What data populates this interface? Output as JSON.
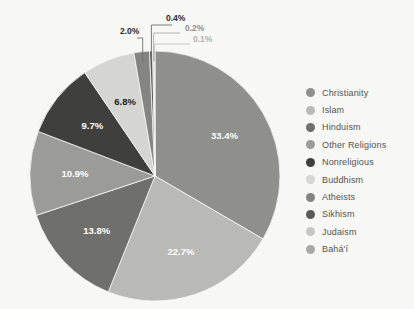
{
  "background": "#f7f7f5",
  "chart_data": {
    "type": "pie",
    "title": "",
    "subtitle": "",
    "xlabel": "",
    "ylabel": "",
    "legend_position": "right",
    "grid": false,
    "start_angle_deg": 0,
    "direction": "clockwise",
    "center": {
      "x": 155,
      "y": 176
    },
    "radius": 125,
    "categories": [
      "Christianity",
      "Islam",
      "Hinduism",
      "Other Religions",
      "Nonreligious",
      "Buddhism",
      "Atheists",
      "Sikhism",
      "Judaism",
      "Bahá'í"
    ],
    "values": [
      33.4,
      22.7,
      13.8,
      10.9,
      9.7,
      6.8,
      2.0,
      0.4,
      0.2,
      0.1
    ],
    "value_labels": [
      "33.4%",
      "22.7%",
      "13.8%",
      "10.9%",
      "9.7%",
      "6.8%",
      "2.0%",
      "0.4%",
      "0.2%",
      "0.1%"
    ],
    "colors": [
      "#8f8f8c",
      "#b9b9b5",
      "#6f6f6c",
      "#9b9b97",
      "#3f3f3d",
      "#d5d5d1",
      "#848480",
      "#5a5a57",
      "#c6c6c2",
      "#a8a8a4"
    ],
    "slices": [
      {
        "label": "Christianity",
        "value": 33.4,
        "text": "33.4%",
        "color": "#8f8f8c",
        "label_placement": "inside",
        "label_style": "light"
      },
      {
        "label": "Islam",
        "value": 22.7,
        "text": "22.7%",
        "color": "#b9b9b5",
        "label_placement": "inside",
        "label_style": "light"
      },
      {
        "label": "Hinduism",
        "value": 13.8,
        "text": "13.8%",
        "color": "#6f6f6c",
        "label_placement": "inside",
        "label_style": "light"
      },
      {
        "label": "Other Religions",
        "value": 10.9,
        "text": "10.9%",
        "color": "#9b9b97",
        "label_placement": "inside",
        "label_style": "light"
      },
      {
        "label": "Nonreligious",
        "value": 9.7,
        "text": "9.7%",
        "color": "#3f3f3d",
        "label_placement": "inside",
        "label_style": "light"
      },
      {
        "label": "Buddhism",
        "value": 6.8,
        "text": "6.8%",
        "color": "#d5d5d1",
        "label_placement": "inside",
        "label_style": "dark"
      },
      {
        "label": "Atheists",
        "value": 2.0,
        "text": "2.0%",
        "color": "#848480",
        "label_placement": "outside",
        "label_style": "dark"
      },
      {
        "label": "Sikhism",
        "value": 0.4,
        "text": "0.4%",
        "color": "#5a5a57",
        "label_placement": "outside",
        "label_style": "dark"
      },
      {
        "label": "Judaism",
        "value": 0.2,
        "text": "0.2%",
        "color": "#c6c6c2",
        "label_placement": "outside",
        "label_style": "mid"
      },
      {
        "label": "Bahá'í",
        "value": 0.1,
        "text": "0.1%",
        "color": "#a8a8a4",
        "label_placement": "outside",
        "label_style": "light-gray"
      }
    ]
  },
  "legend": {
    "items": [
      {
        "label": "Christianity",
        "color": "#8f8f8c"
      },
      {
        "label": "Islam",
        "color": "#b9b9b5"
      },
      {
        "label": "Hinduism",
        "color": "#6f6f6c"
      },
      {
        "label": "Other Religions",
        "color": "#9b9b97"
      },
      {
        "label": "Nonreligious",
        "color": "#3f3f3d"
      },
      {
        "label": "Buddhism",
        "color": "#d5d5d1"
      },
      {
        "label": "Atheists",
        "color": "#848480"
      },
      {
        "label": "Sikhism",
        "color": "#5a5a57"
      },
      {
        "label": "Judaism",
        "color": "#c6c6c2"
      },
      {
        "label": "Bahá'í",
        "color": "#a8a8a4"
      }
    ]
  },
  "outside_labels": [
    {
      "text": "2.0%",
      "x": 120,
      "y": 34,
      "style": "dk"
    },
    {
      "text": "0.4%",
      "x": 166,
      "y": 21,
      "style": "dk"
    },
    {
      "text": "0.2%",
      "x": 185,
      "y": 31,
      "style": "md"
    },
    {
      "text": "0.1%",
      "x": 193,
      "y": 42,
      "style": "lt"
    }
  ],
  "cut_off_header_text": ""
}
